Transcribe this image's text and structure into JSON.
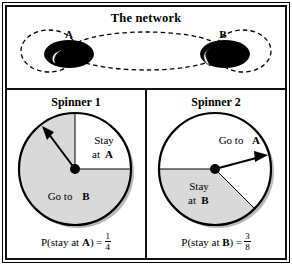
{
  "figure": {
    "width": 292,
    "height": 265
  },
  "colors": {
    "sector_gray": "#d9d9d9",
    "stroke_black": "#000000",
    "background_white": "#ffffff",
    "shadow_gray": "#b0b0b0"
  },
  "network": {
    "title": "The network",
    "nodes": [
      {
        "id": "A",
        "label": "A"
      },
      {
        "id": "B",
        "label": "B"
      }
    ],
    "edges": [
      {
        "from": "A",
        "to": "B",
        "style": "dashed"
      },
      {
        "from": "B",
        "to": "A",
        "style": "dashed"
      },
      {
        "from": "A",
        "to": "A",
        "style": "dashed-self-loop"
      },
      {
        "from": "B",
        "to": "B",
        "style": "dashed-self-loop"
      }
    ]
  },
  "spinners": [
    {
      "title": "Spinner 1",
      "sectors": [
        {
          "label_line1": "Stay",
          "label_line2": "at",
          "label_bold": "A",
          "fill": "white",
          "fraction": 0.25
        },
        {
          "label_line1": "Go to",
          "label_bold": "B",
          "fill": "gray",
          "fraction": 0.75
        }
      ],
      "probability": {
        "prefix": "P(stay at ",
        "bold_symbol": "A",
        "suffix": ") =",
        "numerator": "1",
        "denominator": "4"
      }
    },
    {
      "title": "Spinner 2",
      "sectors": [
        {
          "label_line1": "Go to",
          "label_bold": "A",
          "fill": "white",
          "fraction": 0.625
        },
        {
          "label_line1": "Stay",
          "label_line2": "at",
          "label_bold": "B",
          "fill": "gray",
          "fraction": 0.375
        }
      ],
      "probability": {
        "prefix": "P(stay at ",
        "bold_symbol": "B",
        "suffix": ") =",
        "numerator": "3",
        "denominator": "8"
      }
    }
  ]
}
